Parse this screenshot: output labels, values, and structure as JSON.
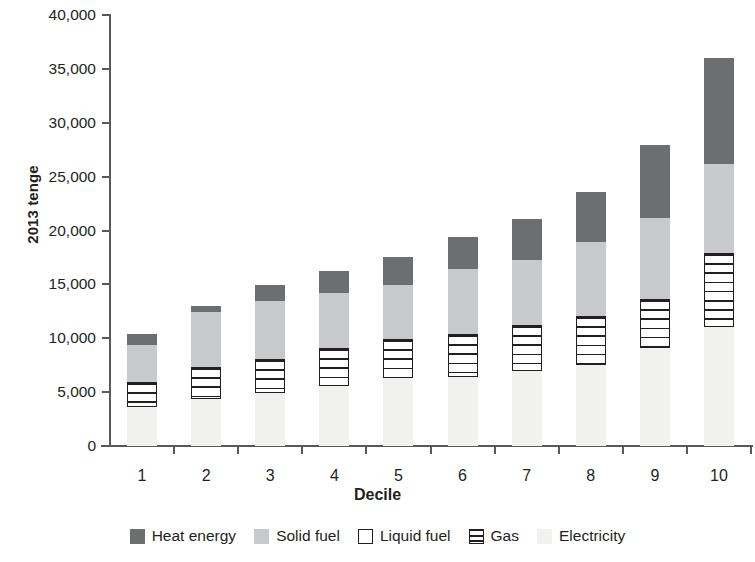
{
  "chart_data": {
    "type": "bar",
    "stacked": true,
    "title": "",
    "subtitle": "",
    "xlabel": "Decile",
    "ylabel": "2013 tenge",
    "categories": [
      "1",
      "2",
      "3",
      "4",
      "5",
      "6",
      "7",
      "8",
      "9",
      "10"
    ],
    "ylim": [
      0,
      40000
    ],
    "ytick_labels": [
      "0",
      "5,000",
      "10,000",
      "15,000",
      "20,000",
      "25,000",
      "30,000",
      "35,000",
      "40,000"
    ],
    "ytick_values": [
      0,
      5000,
      10000,
      15000,
      20000,
      25000,
      30000,
      35000,
      40000
    ],
    "grid": false,
    "legend_position": "bottom",
    "series": [
      {
        "name": "Electricity",
        "color": "#f1f1f0",
        "values": [
          3600,
          4400,
          4900,
          5600,
          6300,
          6400,
          7000,
          7500,
          9100,
          11000
        ]
      },
      {
        "name": "Gas",
        "color": "#ffffff",
        "pattern": "horizontal-lines",
        "values": [
          2300,
          2900,
          3200,
          3500,
          3600,
          4000,
          4200,
          4600,
          4500,
          6900
        ]
      },
      {
        "name": "Liquid fuel",
        "color": "#ffffff",
        "values": [
          0,
          0,
          0,
          0,
          0,
          0,
          0,
          0,
          0,
          0
        ]
      },
      {
        "name": "Solid fuel",
        "color": "#c8c9ca",
        "values": [
          3500,
          5100,
          5400,
          5100,
          5000,
          6000,
          6100,
          6800,
          7600,
          8300
        ]
      },
      {
        "name": "Heat energy",
        "color": "#6d6e70",
        "values": [
          1000,
          600,
          1400,
          2000,
          2600,
          3000,
          3800,
          4700,
          6700,
          9800
        ]
      }
    ],
    "totals": [
      10400,
      13000,
      14900,
      16200,
      17500,
      19400,
      21100,
      23600,
      27900,
      36000
    ],
    "legend": [
      "Heat energy",
      "Solid fuel",
      "Liquid fuel",
      "Gas",
      "Electricity"
    ]
  },
  "axis": {
    "y_title": "2013 tenge",
    "x_title": "Decile"
  }
}
